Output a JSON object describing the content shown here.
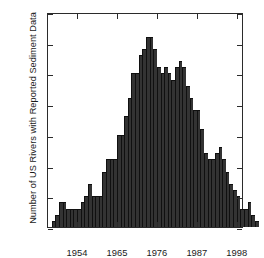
{
  "chart_data": {
    "type": "bar",
    "title": "",
    "xlabel": "",
    "ylabel": "Number of US Rivers with Reported Sediment Data",
    "xlim": [
      1946,
      2000
    ],
    "ylim": [
      0,
      35
    ],
    "grid": false,
    "legend": null,
    "bar_color": "#333333",
    "axis_color": "#2b2b2b",
    "xticks": [
      1954,
      1965,
      1976,
      1987,
      1998
    ],
    "xtick_labels": [
      "1954",
      "1965",
      "1976",
      "1987",
      "1998"
    ],
    "yticks": [
      0,
      5,
      10,
      15,
      20,
      25,
      30,
      35
    ],
    "ytick_labels": [
      "0",
      "5",
      "10",
      "15",
      "20",
      "25",
      "30",
      "35"
    ],
    "categories": [
      1947,
      1948,
      1949,
      1950,
      1951,
      1952,
      1953,
      1954,
      1955,
      1956,
      1957,
      1958,
      1959,
      1960,
      1961,
      1962,
      1963,
      1964,
      1965,
      1966,
      1967,
      1968,
      1969,
      1970,
      1971,
      1972,
      1973,
      1974,
      1975,
      1976,
      1977,
      1978,
      1979,
      1980,
      1981,
      1982,
      1983,
      1984,
      1985,
      1986,
      1987,
      1988,
      1989,
      1990,
      1991,
      1992,
      1993,
      1994
    ],
    "values": [
      1,
      2,
      4,
      4,
      3,
      3,
      3,
      3,
      4,
      5,
      7,
      5,
      5,
      5,
      9,
      11,
      11,
      11,
      15,
      15,
      18,
      21,
      25,
      25,
      28,
      29,
      31,
      31,
      29,
      26,
      25,
      26,
      25,
      24,
      26,
      27,
      26,
      23,
      21,
      19,
      19,
      16,
      12,
      11,
      11,
      12,
      13,
      11
    ],
    "tail_values": [
      9,
      7,
      6,
      5,
      3,
      3,
      4,
      2,
      1
    ]
  }
}
